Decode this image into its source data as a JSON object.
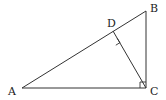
{
  "diagram": {
    "type": "geometry",
    "points": {
      "A": {
        "label": "A",
        "x": 22,
        "y": 88
      },
      "B": {
        "label": "B",
        "x": 146,
        "y": 11
      },
      "C": {
        "label": "C",
        "x": 146,
        "y": 88
      },
      "D": {
        "label": "D",
        "x": 113,
        "y": 31
      }
    },
    "segments": [
      "AB",
      "BC",
      "CA",
      "CD"
    ],
    "right_angles": [
      "C",
      "D"
    ]
  }
}
